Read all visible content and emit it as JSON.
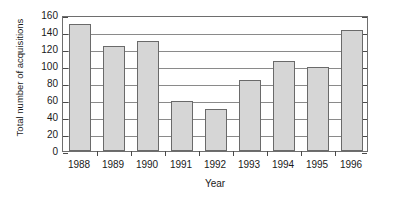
{
  "chart_data": {
    "type": "bar",
    "title": "",
    "xlabel": "Year",
    "ylabel": "Total number of acquisitions",
    "categories": [
      "1988",
      "1989",
      "1990",
      "1991",
      "1992",
      "1993",
      "1994",
      "1995",
      "1996"
    ],
    "values": [
      150,
      123,
      130,
      59,
      50,
      83,
      106,
      99,
      142
    ],
    "ylim": [
      0,
      160
    ],
    "ytick_step": 20,
    "yticks": [
      0,
      20,
      40,
      60,
      80,
      100,
      120,
      140,
      160
    ],
    "ytick_labels": [
      "0",
      "20",
      "40",
      "60",
      "80",
      "100",
      "120",
      "140",
      "160"
    ],
    "grid": true,
    "grid_axis": "y",
    "legend": null,
    "bar_fill_color": "#d6d6d6",
    "bar_edge_color": "#6a6a6a",
    "grid_color": "#8a8a8a",
    "axis_color": "#6e6e6e",
    "text_color": "#1a1a1a"
  }
}
